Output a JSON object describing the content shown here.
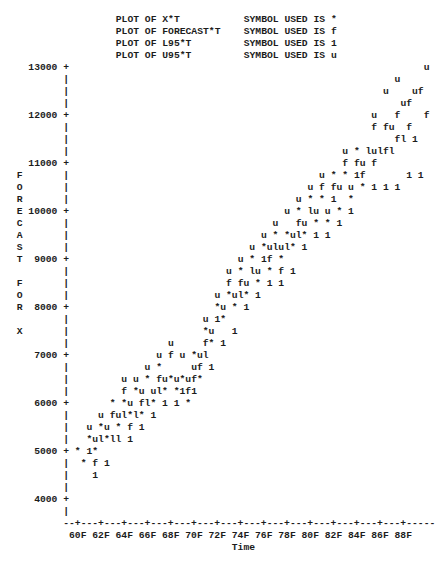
{
  "legend": [
    {
      "plot": "PLOT OF X*T",
      "symbol_text": "SYMBOL USED IS *",
      "symbol": "*"
    },
    {
      "plot": "PLOT OF FORECAST*T",
      "symbol_text": "SYMBOL USED IS f",
      "symbol": "f"
    },
    {
      "plot": "PLOT OF L95*T",
      "symbol_text": "SYMBOL USED IS 1",
      "symbol": "1"
    },
    {
      "plot": "PLOT OF U95*T",
      "symbol_text": "SYMBOL USED IS u",
      "symbol": "u"
    }
  ],
  "y_axis": {
    "label": "FORECAST FOR X",
    "ticks": [
      "13000",
      "12000",
      "11000",
      "10000",
      "9000",
      "8000",
      "7000",
      "6000",
      "5000",
      "4000"
    ]
  },
  "x_axis": {
    "label": "Time",
    "axis_line": "--+---+---+---+---+---+---+---+---+---+---+---+---+---+---+-----",
    "ticks": [
      "60F",
      "62F",
      "64F",
      "66F",
      "68F",
      "70F",
      "72F",
      "74F",
      "76F",
      "78F",
      "80F",
      "82F",
      "84F",
      "86F",
      "88F"
    ]
  },
  "plot_rows": [
    {
      "y": 13000,
      "letter": "",
      "points": [
        [
          62,
          "u"
        ]
      ]
    },
    {
      "y": 12750,
      "letter": "",
      "points": [
        [
          57,
          "u"
        ]
      ]
    },
    {
      "y": 12500,
      "letter": "",
      "points": [
        [
          55,
          "u"
        ],
        [
          60,
          "uf"
        ]
      ]
    },
    {
      "y": 12250,
      "letter": "",
      "points": [
        [
          58,
          "uf"
        ]
      ]
    },
    {
      "y": 12000,
      "letter": "",
      "points": [
        [
          53,
          "u"
        ],
        [
          57,
          "f"
        ],
        [
          62,
          "f"
        ]
      ]
    },
    {
      "y": 11750,
      "letter": "",
      "points": [
        [
          53,
          "f fu"
        ],
        [
          59,
          "f"
        ]
      ]
    },
    {
      "y": 11500,
      "letter": "",
      "points": [
        [
          57,
          "fl 1"
        ]
      ]
    },
    {
      "y": 11250,
      "letter": "",
      "points": [
        [
          48,
          "u * lulfl"
        ]
      ]
    },
    {
      "y": 11000,
      "letter": "",
      "points": [
        [
          48,
          "f fu f"
        ]
      ]
    },
    {
      "y": 10750,
      "letter": "F",
      "points": [
        [
          44,
          "u * * 1f"
        ],
        [
          59,
          "1 1"
        ]
      ]
    },
    {
      "y": 10500,
      "letter": "O",
      "points": [
        [
          42,
          "u f fu u * 1 1 1"
        ]
      ]
    },
    {
      "y": 10250,
      "letter": "R",
      "points": [
        [
          40,
          "u * * 1  *"
        ]
      ]
    },
    {
      "y": 10000,
      "letter": "E",
      "points": [
        [
          38,
          "u * lu u * 1"
        ]
      ]
    },
    {
      "y": 9750,
      "letter": "C",
      "points": [
        [
          36,
          "u   fu * * 1"
        ]
      ]
    },
    {
      "y": 9500,
      "letter": "A",
      "points": [
        [
          34,
          "u * *ul* 1 1"
        ]
      ]
    },
    {
      "y": 9250,
      "letter": "S",
      "points": [
        [
          32,
          "u *ulul* 1"
        ]
      ]
    },
    {
      "y": 9000,
      "letter": "T",
      "points": [
        [
          30,
          "u * 1f *"
        ]
      ]
    },
    {
      "y": 8750,
      "letter": "",
      "points": [
        [
          28,
          "u * lu * f 1"
        ]
      ]
    },
    {
      "y": 8500,
      "letter": "F",
      "points": [
        [
          28,
          "f fu * 1 1"
        ]
      ]
    },
    {
      "y": 8250,
      "letter": "O",
      "points": [
        [
          26,
          "u *ul* 1"
        ]
      ]
    },
    {
      "y": 8000,
      "letter": "R",
      "points": [
        [
          26,
          "*u * 1"
        ]
      ]
    },
    {
      "y": 7750,
      "letter": "",
      "points": [
        [
          24,
          "u 1*"
        ]
      ]
    },
    {
      "y": 7500,
      "letter": "X",
      "points": [
        [
          24,
          "*u   1"
        ]
      ]
    },
    {
      "y": 7250,
      "letter": "",
      "points": [
        [
          18,
          "u"
        ],
        [
          24,
          "f* 1"
        ]
      ]
    },
    {
      "y": 7000,
      "letter": "",
      "points": [
        [
          16,
          "u f u *ul"
        ]
      ]
    },
    {
      "y": 6750,
      "letter": "",
      "points": [
        [
          14,
          "u *"
        ],
        [
          22,
          "uf 1"
        ]
      ]
    },
    {
      "y": 6500,
      "letter": "",
      "points": [
        [
          10,
          "u u * fu*u*uf*"
        ]
      ]
    },
    {
      "y": 6250,
      "letter": "",
      "points": [
        [
          10,
          "f *u ul* *1f1"
        ]
      ]
    },
    {
      "y": 6000,
      "letter": "",
      "points": [
        [
          8,
          "* *u fl* 1 1 *"
        ]
      ]
    },
    {
      "y": 5750,
      "letter": "",
      "points": [
        [
          6,
          "u ful*l* 1"
        ]
      ]
    },
    {
      "y": 5500,
      "letter": "",
      "points": [
        [
          4,
          "u *u * f 1"
        ]
      ]
    },
    {
      "y": 5250,
      "letter": "",
      "points": [
        [
          4,
          "*ul*ll 1"
        ]
      ]
    },
    {
      "y": 5000,
      "letter": "",
      "points": [
        [
          2,
          "* 1*"
        ]
      ]
    },
    {
      "y": 4750,
      "letter": "",
      "points": [
        [
          3,
          "* f 1"
        ]
      ]
    },
    {
      "y": 4500,
      "letter": "",
      "points": [
        [
          5,
          "1"
        ]
      ]
    },
    {
      "y": 4250,
      "letter": "",
      "points": []
    },
    {
      "y": 4000,
      "letter": "",
      "points": []
    },
    {
      "y": 3750,
      "letter": "",
      "points": []
    }
  ],
  "chart_data": {
    "type": "scatter",
    "title": "",
    "subtitle": "PLOT OF X*T / FORECAST*T / L95*T / U95*T",
    "xlabel": "Time",
    "ylabel": "FORECAST FOR X",
    "x_ticks": [
      "60F",
      "62F",
      "64F",
      "66F",
      "68F",
      "70F",
      "72F",
      "74F",
      "76F",
      "78F",
      "80F",
      "82F",
      "84F",
      "86F",
      "88F"
    ],
    "y_ticks": [
      4000,
      5000,
      6000,
      7000,
      8000,
      9000,
      10000,
      11000,
      12000,
      13000
    ],
    "ylim": [
      3750,
      13000
    ],
    "grid": false,
    "legend_position": "top",
    "series": [
      {
        "name": "X",
        "symbol": "*"
      },
      {
        "name": "FORECAST",
        "symbol": "f"
      },
      {
        "name": "L95",
        "symbol": "1"
      },
      {
        "name": "U95",
        "symbol": "u"
      }
    ],
    "trend": {
      "start": {
        "x": "60F",
        "y": 5000
      },
      "end": {
        "x": "88F",
        "y": 12500
      }
    }
  }
}
